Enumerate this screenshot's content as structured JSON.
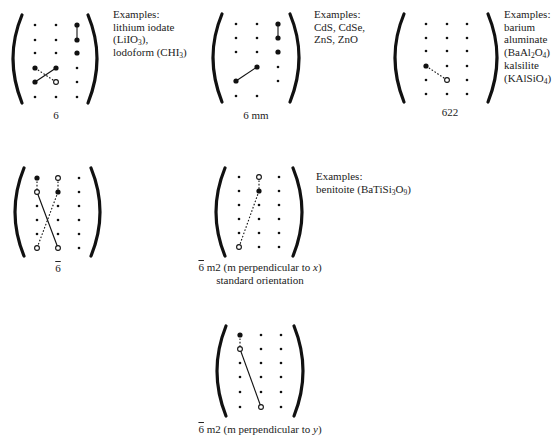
{
  "figure": {
    "panels": [
      {
        "id": "p6",
        "label": "6",
        "examples": [
          "Examples:",
          "lithium iodate",
          "(LiIO<sub>3</sub>),",
          "lodoform (CHI<sub>3</sub>)"
        ]
      },
      {
        "id": "p6mm",
        "label": "6 mm",
        "examples": [
          "Examples:",
          "CdS, CdSe,",
          "ZnS, ZnO"
        ]
      },
      {
        "id": "p622",
        "label": "622",
        "examples": [
          "Examples:",
          "barium",
          "aluminate",
          "(BaAl<sub>2</sub>O<sub>4</sub>)",
          "kalsilite",
          "(KAlSiO<sub>4</sub>)"
        ]
      },
      {
        "id": "p6bar",
        "label_symbol": "6",
        "label_overbar": true,
        "label": "6̄"
      },
      {
        "id": "p6barm2x",
        "label_symbol": "6",
        "label_rest": " m2 (m perpendicular to ",
        "label_axis": "x",
        "label_close": ")",
        "label_line2": "standard orientation",
        "examples": [
          "Examples:",
          "benitoite (BaTiSi<sub>3</sub>O<sub>9</sub>)"
        ]
      },
      {
        "id": "p6barm2y",
        "label_symbol": "6",
        "label_rest": " m2 (m perpendicular to ",
        "label_axis": "y",
        "label_close": ")"
      }
    ]
  }
}
